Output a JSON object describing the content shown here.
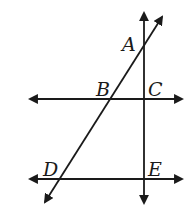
{
  "diagram": {
    "type": "geometry-lines",
    "line_color": "#1a1a1a",
    "background": "#ffffff",
    "labels": {
      "A": "A",
      "B": "B",
      "C": "C",
      "D": "D",
      "E": "E"
    },
    "lines": [
      {
        "name": "upper-horizontal",
        "through": [
          "B",
          "C"
        ],
        "arrows": "both"
      },
      {
        "name": "lower-horizontal",
        "through": [
          "D",
          "E"
        ],
        "arrows": "both"
      },
      {
        "name": "vertical",
        "through": [
          "A",
          "C",
          "E"
        ],
        "arrows": "both"
      },
      {
        "name": "diagonal",
        "through": [
          "A",
          "B",
          "D"
        ],
        "arrows": "both"
      }
    ]
  }
}
